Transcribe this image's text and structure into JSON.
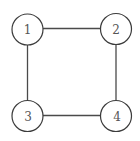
{
  "diagram": {
    "type": "undirected-graph",
    "nodes": [
      {
        "id": "1",
        "label": "1",
        "cx": 27.5,
        "cy": 29.5,
        "r": 15.5
      },
      {
        "id": "2",
        "label": "2",
        "cx": 116,
        "cy": 29,
        "r": 15.5
      },
      {
        "id": "3",
        "label": "3",
        "cx": 27.5,
        "cy": 116,
        "r": 15.5
      },
      {
        "id": "4",
        "label": "4",
        "cx": 116,
        "cy": 116,
        "r": 15.5
      }
    ],
    "edges": [
      {
        "from": "1",
        "to": "2"
      },
      {
        "from": "1",
        "to": "3"
      },
      {
        "from": "2",
        "to": "4"
      },
      {
        "from": "3",
        "to": "4"
      }
    ],
    "colors": {
      "edge": "#4a4a4a",
      "node_stroke": "#3c3c3c",
      "label": "#555555",
      "background": "#ffffff"
    }
  }
}
